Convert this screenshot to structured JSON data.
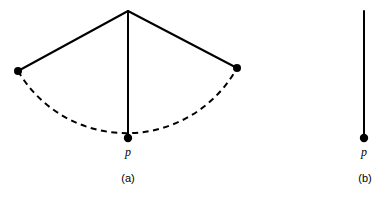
{
  "figure": {
    "background_color": "#ffffff",
    "stroke_color": "#000000",
    "width": 386,
    "height": 199,
    "panels": [
      {
        "id": "a",
        "caption": "(a)",
        "caption_x": 128,
        "caption_y": 182,
        "apex": {
          "x": 128,
          "y": 11
        },
        "radius": 126,
        "solid_radii": [
          {
            "name": "left-radius",
            "x1": 128,
            "y1": 11,
            "x2": 18,
            "y2": 71
          },
          {
            "name": "center-radius",
            "x1": 128,
            "y1": 11,
            "x2": 128,
            "y2": 138
          },
          {
            "name": "right-radius",
            "x1": 128,
            "y1": 11,
            "x2": 237,
            "y2": 68
          }
        ],
        "dashed_arc": {
          "name": "dashed-arc",
          "path": "M 18 71 A 126 126 0 0 0 237 68",
          "dash_pattern": "6 4.5"
        },
        "vertices": [
          {
            "name": "left-vertex",
            "x": 18,
            "y": 71,
            "r": 4,
            "label": ""
          },
          {
            "name": "right-vertex",
            "x": 237,
            "y": 68,
            "r": 4,
            "label": ""
          },
          {
            "name": "point-p",
            "x": 128,
            "y": 138,
            "r": 4.2,
            "label": "p",
            "label_x": 128,
            "label_y": 156
          }
        ]
      },
      {
        "id": "b",
        "caption": "(b)",
        "caption_x": 365,
        "caption_y": 182,
        "apex": {
          "x": 364,
          "y": 11
        },
        "radius": 0,
        "solid_radii": [
          {
            "name": "center-radius",
            "x1": 364,
            "y1": 11,
            "x2": 364,
            "y2": 138
          }
        ],
        "dashed_arc": null,
        "vertices": [
          {
            "name": "point-p",
            "x": 364,
            "y": 138,
            "r": 4.2,
            "label": "p",
            "label_x": 364,
            "label_y": 156
          }
        ]
      }
    ]
  },
  "labels": {
    "panel_a_caption": "(a)",
    "panel_b_caption": "(b)",
    "panel_a_point_p": "p",
    "panel_b_point_p": "p"
  }
}
